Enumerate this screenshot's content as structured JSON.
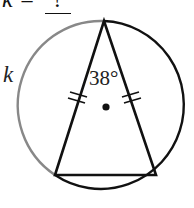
{
  "problem": {
    "variable": "k",
    "equals": "=",
    "answer": "?"
  },
  "figure": {
    "arc_label": "k",
    "apex_angle": "38°",
    "apex_angle_value": 38,
    "equal_sides_marks": "double tick",
    "center_point": "circle center",
    "colors": {
      "circle": "#111111",
      "highlighted_arc": "#888888",
      "triangle": "#111111"
    }
  }
}
